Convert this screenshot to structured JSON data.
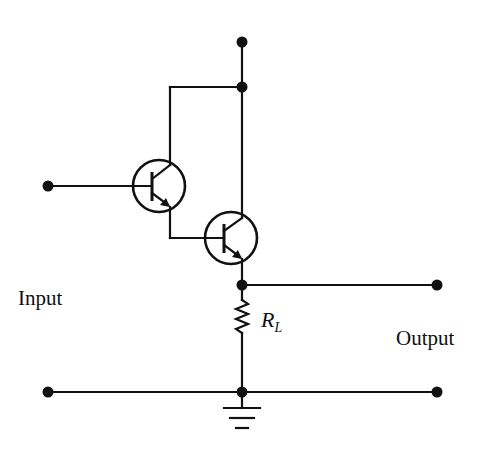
{
  "diagram": {
    "labels": {
      "input": "Input",
      "output": "Output",
      "resistor_main": "R",
      "resistor_sub": "L"
    },
    "components": {
      "transistors": [
        {
          "id": "Q1",
          "type": "NPN",
          "center": [
            159,
            186
          ],
          "radius": 26
        },
        {
          "id": "Q2",
          "type": "NPN",
          "center": [
            231,
            238
          ],
          "radius": 26
        }
      ],
      "resistor": {
        "id": "RL",
        "from": [
          242,
          285
        ],
        "to": [
          242,
          338
        ]
      },
      "ground": {
        "at": [
          242,
          392
        ]
      }
    },
    "terminals": {
      "supply": [
        242,
        42
      ],
      "input": [
        48,
        186
      ],
      "output": [
        437,
        285
      ],
      "common_left": [
        48,
        392
      ],
      "common_right": [
        437,
        392
      ]
    },
    "colors": {
      "stroke": "#111111",
      "background": "#ffffff"
    }
  }
}
